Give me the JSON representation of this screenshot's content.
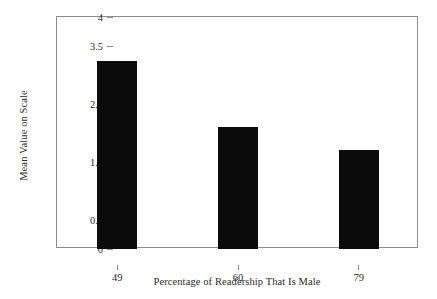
{
  "chart_data": {
    "type": "bar",
    "title": "",
    "subtitle": "",
    "xlabel": "Percentage of Readership That Is Male",
    "ylabel": "Mean Value on Scale",
    "categories": [
      "49",
      "60",
      "79"
    ],
    "values": [
      3.25,
      2.11,
      1.71
    ],
    "series": [
      {
        "name": "Mean Value on Scale",
        "values": [
          3.25,
          2.11,
          1.71
        ]
      }
    ],
    "ylim": [
      0,
      4
    ],
    "ytick_labels": [
      "0",
      "0.5",
      "1",
      "1.5",
      "2",
      "2.5",
      "3",
      "3.5",
      "4"
    ],
    "ytick_values": [
      0,
      0.5,
      1,
      1.5,
      2,
      2.5,
      3,
      3.5,
      4
    ],
    "xtick_labels": [
      "49",
      "60",
      "79"
    ],
    "grid": false,
    "legend": "none",
    "bar_color": "#0b0b0b",
    "axis_color": "#8e8e8e",
    "background_color": "#ffffff",
    "text_color": "#2b2b2b"
  }
}
